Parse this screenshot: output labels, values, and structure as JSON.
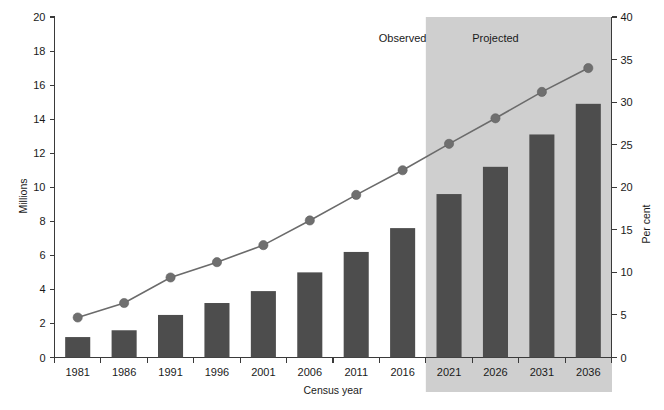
{
  "chart_data": {
    "type": "bar",
    "title": "",
    "subtitle": "",
    "xlabel": "Census year",
    "ylabel": "Millions",
    "y2label": "Per cent",
    "categories": [
      "1981",
      "1986",
      "1991",
      "1996",
      "2001",
      "2006",
      "2011",
      "2016",
      "2021",
      "2026",
      "2031",
      "2036"
    ],
    "series": [
      {
        "name": "Millions",
        "type": "bar",
        "axis": "left",
        "values": [
          1.2,
          1.6,
          2.5,
          3.2,
          3.9,
          5.0,
          6.2,
          7.6,
          9.6,
          11.2,
          13.1,
          14.9
        ]
      },
      {
        "name": "Per cent",
        "type": "line",
        "axis": "right",
        "values": [
          4.7,
          6.4,
          9.4,
          11.2,
          13.2,
          16.1,
          19.1,
          22.0,
          25.1,
          28.1,
          31.2,
          34.0
        ]
      }
    ],
    "ylim": [
      0,
      20
    ],
    "yticks": [
      0,
      2,
      4,
      6,
      8,
      10,
      12,
      14,
      16,
      18,
      20
    ],
    "y2lim": [
      0,
      40
    ],
    "y2ticks": [
      0,
      5,
      10,
      15,
      20,
      25,
      30,
      35,
      40
    ],
    "grid": false,
    "legend_position": "none",
    "annotations": [
      {
        "text": "Observed",
        "x_category": "2016",
        "note": "label over unshaded left region"
      },
      {
        "text": "Projected",
        "x_category": "2026",
        "note": "label over shaded right region"
      }
    ],
    "shaded_region": {
      "label": "Projected",
      "from_category": "2021",
      "to_category": "2036",
      "color": "#cfcfcf"
    },
    "colors": {
      "bar": "#4d4d4d",
      "line": "#6b6b6b",
      "marker": "#6f6f6f",
      "axis": "#3a3a3a",
      "shade": "#cfcfcf",
      "background": "#ffffff"
    }
  },
  "labels": {
    "observed": "Observed",
    "projected": "Projected",
    "y_axis_title": "Millions",
    "y2_axis_title": "Per cent",
    "x_axis_title": "Census year"
  }
}
